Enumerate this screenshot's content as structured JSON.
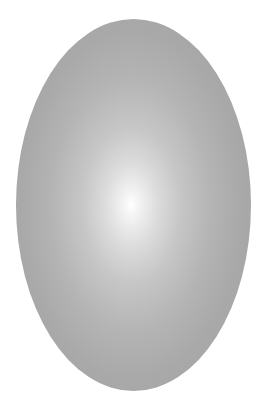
{
  "scene": {
    "description": "Gray ellipse with radial gradient highlight on white background",
    "shape": "ellipse",
    "colors": {
      "background": "#ffffff",
      "highlight": "#ffffff",
      "edge": "#a3a3a3"
    }
  }
}
